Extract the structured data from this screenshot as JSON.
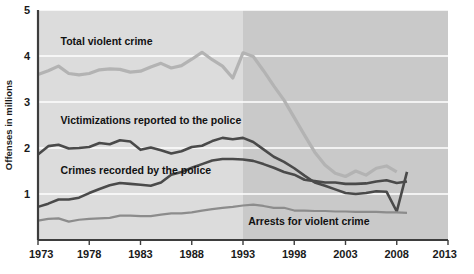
{
  "chart_data": {
    "type": "line",
    "title": "",
    "xlabel": "",
    "ylabel": "Offenses in millions",
    "xlim": [
      1973,
      2013
    ],
    "ylim": [
      0,
      5
    ],
    "grid": true,
    "legend_position": "inline-labels",
    "xticks": [
      "1973",
      "1978",
      "1983",
      "1988",
      "1993",
      "1998",
      "2003",
      "2008",
      "2013"
    ],
    "yticks": [
      "1",
      "2",
      "3",
      "4",
      "5"
    ],
    "shaded_region": {
      "from": 1993,
      "to": 2013,
      "light_color": "#dcdcdc",
      "dark_color": "#c9c9c9"
    },
    "series": [
      {
        "name": "Total violent crime",
        "color": "#b3b3b3",
        "label_x": 1975.2,
        "label_y": 4.25,
        "x": [
          1973,
          1974,
          1975,
          1976,
          1977,
          1978,
          1979,
          1980,
          1981,
          1982,
          1983,
          1984,
          1985,
          1986,
          1987,
          1988,
          1989,
          1990,
          1991,
          1992,
          1993,
          1994,
          1995,
          1996,
          1997,
          1998,
          1999,
          2000,
          2001,
          2002,
          2003,
          2004,
          2005,
          2006,
          2007,
          2008
        ],
        "values": [
          3.6,
          3.68,
          3.78,
          3.62,
          3.59,
          3.62,
          3.7,
          3.72,
          3.71,
          3.65,
          3.67,
          3.76,
          3.84,
          3.74,
          3.79,
          3.93,
          4.08,
          3.92,
          3.78,
          3.52,
          4.07,
          3.99,
          3.68,
          3.35,
          3.04,
          2.66,
          2.28,
          1.91,
          1.63,
          1.45,
          1.38,
          1.5,
          1.41,
          1.56,
          1.61,
          1.48
        ]
      },
      {
        "name": "Victimizations reported to the police",
        "color": "#4a4a4a",
        "label_x": 1975.2,
        "label_y": 2.52,
        "x": [
          1973,
          1974,
          1975,
          1976,
          1977,
          1978,
          1979,
          1980,
          1981,
          1982,
          1983,
          1984,
          1985,
          1986,
          1987,
          1988,
          1989,
          1990,
          1991,
          1992,
          1993,
          1994,
          1995,
          1996,
          1997,
          1998,
          1999,
          2000,
          2001,
          2002,
          2003,
          2004,
          2005,
          2006,
          2007,
          2008,
          2009
        ],
        "values": [
          1.86,
          2.04,
          2.07,
          1.99,
          2.0,
          2.02,
          2.11,
          2.08,
          2.17,
          2.14,
          1.96,
          2.01,
          1.95,
          1.88,
          1.93,
          2.02,
          2.05,
          2.15,
          2.22,
          2.19,
          2.22,
          2.13,
          1.97,
          1.81,
          1.7,
          1.56,
          1.4,
          1.25,
          1.18,
          1.1,
          1.02,
          1.0,
          1.02,
          1.06,
          1.05,
          0.62,
          1.48
        ]
      },
      {
        "name": "Crimes recorded by the police",
        "color": "#4a4a4a",
        "label_x": 1975.2,
        "label_y": 1.44,
        "x": [
          1973,
          1974,
          1975,
          1976,
          1977,
          1978,
          1979,
          1980,
          1981,
          1982,
          1983,
          1984,
          1985,
          1986,
          1987,
          1988,
          1989,
          1990,
          1991,
          1992,
          1993,
          1994,
          1995,
          1996,
          1997,
          1998,
          1999,
          2000,
          2001,
          2002,
          2003,
          2004,
          2005,
          2006,
          2007,
          2008,
          2009
        ],
        "values": [
          0.72,
          0.79,
          0.88,
          0.88,
          0.92,
          1.02,
          1.11,
          1.19,
          1.24,
          1.22,
          1.2,
          1.18,
          1.25,
          1.42,
          1.48,
          1.57,
          1.65,
          1.73,
          1.76,
          1.76,
          1.75,
          1.72,
          1.65,
          1.57,
          1.48,
          1.42,
          1.31,
          1.28,
          1.25,
          1.25,
          1.22,
          1.22,
          1.23,
          1.27,
          1.3,
          1.24,
          1.27
        ]
      },
      {
        "name": "Arrests for violent crime",
        "color": "#8c8c8c",
        "label_x": 1993.5,
        "label_y": 0.32,
        "x": [
          1973,
          1974,
          1975,
          1976,
          1977,
          1978,
          1979,
          1980,
          1981,
          1982,
          1983,
          1984,
          1985,
          1986,
          1987,
          1988,
          1989,
          1990,
          1991,
          1992,
          1993,
          1994,
          1995,
          1996,
          1997,
          1998,
          1999,
          2000,
          2001,
          2002,
          2003,
          2004,
          2005,
          2006,
          2007,
          2008,
          2009
        ],
        "values": [
          0.42,
          0.46,
          0.47,
          0.4,
          0.44,
          0.46,
          0.47,
          0.48,
          0.53,
          0.53,
          0.52,
          0.52,
          0.55,
          0.58,
          0.58,
          0.6,
          0.64,
          0.67,
          0.7,
          0.72,
          0.75,
          0.77,
          0.74,
          0.7,
          0.7,
          0.64,
          0.64,
          0.63,
          0.63,
          0.62,
          0.62,
          0.61,
          0.61,
          0.61,
          0.6,
          0.6,
          0.59
        ]
      }
    ]
  }
}
